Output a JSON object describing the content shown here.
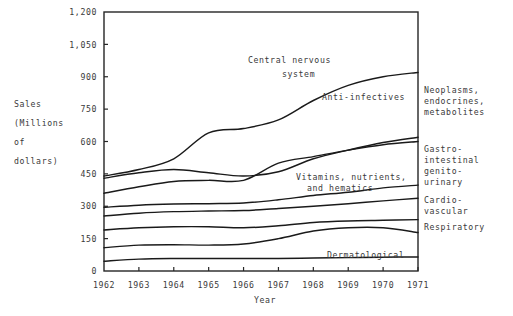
{
  "figure": {
    "width": 513,
    "height": 316,
    "background": "#ffffff",
    "ink": "#1a1a1a"
  },
  "axis_label_y_lines": [
    "Sales",
    "(Millions",
    "of",
    "dollars)"
  ],
  "axis_label_x": "Year",
  "right_labels": [
    {
      "name": "neoplasms",
      "lines": [
        "Neoplasms,",
        "endocrines,",
        "metabolites"
      ]
    },
    {
      "name": "gastro-intestinal",
      "lines": [
        "Gastro-",
        "intestinal",
        "genito-",
        "urinary"
      ]
    },
    {
      "name": "cardio-vascular",
      "lines": [
        "Cardio-",
        "vascular"
      ]
    },
    {
      "name": "respiratory",
      "lines": [
        "Respiratory"
      ]
    }
  ],
  "inline_labels": [
    {
      "name": "central-nervous-system",
      "lines": [
        "Central nervous",
        "system"
      ]
    },
    {
      "name": "anti-infectives",
      "lines": [
        "Anti-infectives"
      ]
    },
    {
      "name": "vitamins-nutrients-hematics",
      "lines": [
        "Vitamins, nutrients,",
        "and hematics"
      ]
    },
    {
      "name": "dermatological",
      "lines": [
        "Dermatological"
      ]
    }
  ],
  "chart_data": {
    "type": "line",
    "title": "",
    "xlabel": "Year",
    "ylabel": "Sales (Millions of dollars)",
    "grid": false,
    "legend": "inline-annotations",
    "x": [
      1962,
      1963,
      1964,
      1965,
      1966,
      1967,
      1968,
      1969,
      1970,
      1971
    ],
    "xtick_labels": [
      "1962",
      "1963",
      "1964",
      "1965",
      "1966",
      "1967",
      "1968",
      "1969",
      "1970",
      "1971"
    ],
    "xlim": [
      1962,
      1971
    ],
    "ytick_labels": [
      "0",
      "150",
      "300",
      "450",
      "600",
      "750",
      "900",
      "1,050",
      "1,200"
    ],
    "yticks": [
      0,
      150,
      300,
      450,
      600,
      750,
      900,
      1050,
      1200
    ],
    "ylim": [
      0,
      1200
    ],
    "series": [
      {
        "name": "Central nervous system",
        "label_side": "inline",
        "values": [
          440,
          470,
          520,
          640,
          660,
          700,
          790,
          860,
          900,
          920
        ]
      },
      {
        "name": "Anti-infectives",
        "label_side": "inline",
        "values": [
          430,
          455,
          470,
          455,
          440,
          460,
          520,
          560,
          595,
          620
        ]
      },
      {
        "name": "Vitamins, nutrients, and hematics",
        "label_side": "inline",
        "values": [
          360,
          390,
          415,
          420,
          420,
          500,
          530,
          560,
          585,
          600
        ]
      },
      {
        "name": "Neoplasms, endocrines, metabolites",
        "label_side": "right",
        "values": [
          295,
          305,
          310,
          312,
          315,
          330,
          350,
          365,
          385,
          398
        ]
      },
      {
        "name": "Gastro-intestinal genito-urinary",
        "label_side": "right",
        "values": [
          255,
          268,
          275,
          278,
          280,
          290,
          300,
          312,
          325,
          337
        ]
      },
      {
        "name": "Cardio-vascular",
        "label_side": "right",
        "values": [
          190,
          200,
          205,
          205,
          200,
          210,
          225,
          232,
          235,
          238
        ]
      },
      {
        "name": "Respiratory",
        "label_side": "right",
        "values": [
          108,
          120,
          122,
          120,
          125,
          150,
          185,
          200,
          200,
          178
        ]
      },
      {
        "name": "Dermatological",
        "label_side": "inline",
        "values": [
          45,
          55,
          58,
          58,
          58,
          58,
          60,
          62,
          64,
          65
        ]
      }
    ]
  }
}
